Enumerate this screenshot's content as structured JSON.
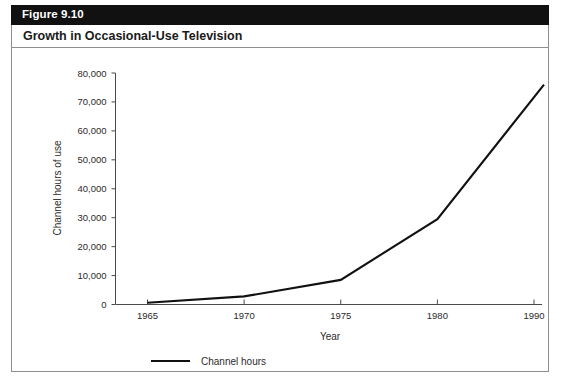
{
  "figure": {
    "number_label": "Figure 9.10",
    "title": "Growth in Occasional-Use Television"
  },
  "chart_data": {
    "type": "line",
    "title": "Growth in Occasional-Use Television",
    "xlabel": "Year",
    "ylabel": "Channel hours of use",
    "categories": [
      "1965",
      "1970",
      "1975",
      "1980",
      "1990"
    ],
    "x": [
      1965,
      1970,
      1975,
      1980,
      1991
    ],
    "xtick_labels": [
      "1965",
      "1970",
      "1975",
      "1980",
      "1990"
    ],
    "ytick_labels": [
      "0",
      "10,000",
      "20,000",
      "30,000",
      "40,000",
      "50,000",
      "60,000",
      "70,000",
      "80,000"
    ],
    "ytick_values": [
      0,
      10000,
      20000,
      30000,
      40000,
      50000,
      60000,
      70000,
      80000
    ],
    "ylim": [
      0,
      80000
    ],
    "grid": false,
    "legend_position": "bottom-left",
    "series": [
      {
        "name": "Channel hours",
        "color": "#111111",
        "values": [
          600,
          2800,
          8500,
          29500,
          76000
        ]
      }
    ]
  },
  "legend": {
    "entries": [
      {
        "label": "Channel hours",
        "color": "#111111"
      }
    ]
  },
  "colors": {
    "header_bar": "#111111",
    "header_text": "#ffffff",
    "border": "#8f8f8f",
    "line": "#111111",
    "axis": "#4a4a4a",
    "text": "#2b2b2b",
    "background": "#ffffff"
  }
}
